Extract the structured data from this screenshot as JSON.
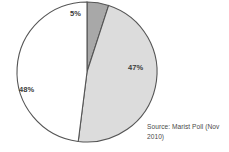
{
  "chart_data": {
    "type": "pie",
    "title": "",
    "categories": [
      "47%",
      "48%",
      "5%"
    ],
    "values": [
      47,
      48,
      5
    ],
    "labels": [
      "47%",
      "48%",
      "5%"
    ],
    "colors": [
      "#dcdcdc",
      "#ffffff",
      "#a8a8a8"
    ],
    "legend_position": "none",
    "grid": false,
    "annotations": [
      "Source: Marist Poll (Nov 2010)"
    ],
    "slices": [
      {
        "label": "5%",
        "value": 5,
        "color": "#a8a8a8",
        "start_angle": 0,
        "end_angle": 18
      },
      {
        "label": "47%",
        "value": 47,
        "color": "#dcdcdc",
        "start_angle": 18,
        "end_angle": 187.2
      },
      {
        "label": "48%",
        "value": 48,
        "color": "#ffffff",
        "start_angle": 187.2,
        "end_angle": 360
      }
    ]
  },
  "chart": {
    "labels": {
      "slice_one": "47%",
      "slice_two": "48%",
      "slice_three": "5%"
    }
  },
  "source": {
    "text": "Source: Marist Poll (Nov 2010)"
  },
  "style": {
    "stroke": "#555555",
    "fill_light": "#dcdcdc",
    "fill_white": "#ffffff",
    "fill_dark": "#a8a8a8",
    "text_color": "#3a3a3a"
  }
}
